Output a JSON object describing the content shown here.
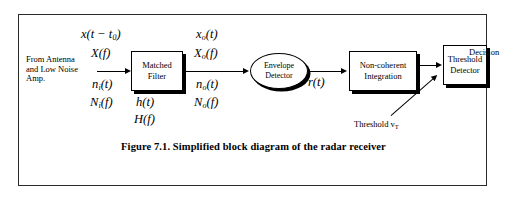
{
  "figure": {
    "caption": "Figure 7.1. Simplified block diagram of the radar receiver",
    "frame_color": "#2b2b2b"
  },
  "source": {
    "line1": "From Antenna",
    "line2": "and Low Noise",
    "line3": "Amp."
  },
  "input_signals": {
    "time_signal": "x(t − t",
    "time_signal_sub": "0",
    "time_signal_tail": ")",
    "spectrum": "X(f)",
    "noise_time": "n",
    "noise_time_sub": "i",
    "noise_time_tail": "(t)",
    "noise_spectrum": "N",
    "noise_spectrum_sub": "i",
    "noise_spectrum_tail": "(f)"
  },
  "blocks": {
    "matched_filter": {
      "line1": "Matched",
      "line2": "Filter",
      "impulse_response": "h(t)",
      "transfer_function": "H(f)"
    },
    "envelope_detector": {
      "line1": "Envelope",
      "line2": "Detector"
    },
    "non_coherent_integration": {
      "line1": "Non-coherent",
      "line2": "Integration"
    },
    "threshold_detector": {
      "line1": "Threshold",
      "line2": "Detector"
    }
  },
  "output_signals": {
    "time_signal": "x",
    "time_signal_sub": "o",
    "time_signal_tail": "(t)",
    "spectrum": "X",
    "spectrum_sub": "o",
    "spectrum_tail": "(f)",
    "noise_time": "n",
    "noise_time_sub": "o",
    "noise_time_tail": "(t)",
    "noise_spectrum": "N",
    "noise_spectrum_sub": "o",
    "noise_spectrum_tail": "(f)"
  },
  "envelope_output": {
    "label": "r(t)"
  },
  "threshold": {
    "label": "Threshold v",
    "label_sub": "T"
  },
  "decision": {
    "label": "Decision"
  }
}
